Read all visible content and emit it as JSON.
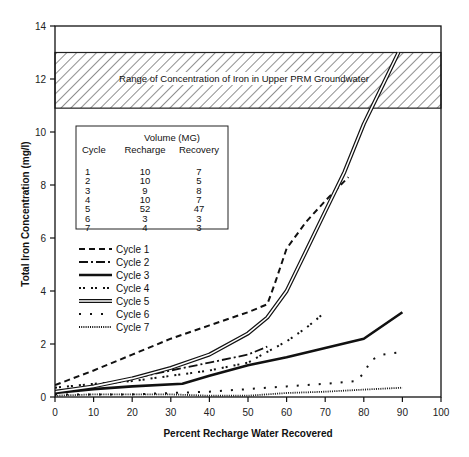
{
  "chart_data": {
    "type": "line",
    "title": "",
    "xlabel": "Percent Recharge Water Recovered",
    "ylabel": "Total Iron Concentration (mg/l)",
    "xlim": [
      0,
      100
    ],
    "ylim": [
      0,
      14
    ],
    "x_ticks": [
      0,
      10,
      20,
      30,
      40,
      50,
      60,
      70,
      80,
      90,
      100
    ],
    "y_ticks": [
      0,
      2,
      4,
      6,
      8,
      10,
      12,
      14
    ],
    "grid": false,
    "legend_position": "left-middle",
    "annotation_band": {
      "label": "Range of Concentration of Iron in Upper PRM Groundwater",
      "y_min": 10.9,
      "y_max": 13.0,
      "pattern": "diagonal-hatch"
    },
    "series": [
      {
        "name": "Cycle 1",
        "style": "dashed",
        "points": [
          [
            0,
            0.45
          ],
          [
            10,
            1.0
          ],
          [
            20,
            1.6
          ],
          [
            30,
            2.2
          ],
          [
            40,
            2.7
          ],
          [
            50,
            3.2
          ],
          [
            55,
            3.5
          ],
          [
            57,
            4.3
          ],
          [
            60,
            5.6
          ],
          [
            65,
            6.6
          ],
          [
            70,
            7.4
          ],
          [
            76,
            8.3
          ]
        ]
      },
      {
        "name": "Cycle 2",
        "style": "dash-dot",
        "points": [
          [
            0,
            0.2
          ],
          [
            10,
            0.4
          ],
          [
            20,
            0.7
          ],
          [
            30,
            1.0
          ],
          [
            40,
            1.3
          ],
          [
            50,
            1.6
          ],
          [
            55,
            1.9
          ]
        ]
      },
      {
        "name": "Cycle 3",
        "style": "thick-solid",
        "points": [
          [
            0,
            0.15
          ],
          [
            10,
            0.3
          ],
          [
            20,
            0.4
          ],
          [
            33,
            0.5
          ],
          [
            40,
            0.8
          ],
          [
            50,
            1.2
          ],
          [
            60,
            1.5
          ],
          [
            70,
            1.85
          ],
          [
            80,
            2.2
          ],
          [
            90,
            3.2
          ]
        ]
      },
      {
        "name": "Cycle 4",
        "style": "dotted-pairs",
        "points": [
          [
            0,
            0.35
          ],
          [
            10,
            0.5
          ],
          [
            20,
            0.6
          ],
          [
            30,
            0.8
          ],
          [
            40,
            1.0
          ],
          [
            50,
            1.3
          ],
          [
            55,
            1.7
          ],
          [
            60,
            2.1
          ],
          [
            65,
            2.6
          ],
          [
            70,
            3.2
          ]
        ]
      },
      {
        "name": "Cycle 5",
        "style": "double-line",
        "points": [
          [
            0,
            0.2
          ],
          [
            10,
            0.4
          ],
          [
            20,
            0.7
          ],
          [
            30,
            1.1
          ],
          [
            40,
            1.6
          ],
          [
            50,
            2.4
          ],
          [
            55,
            3.0
          ],
          [
            60,
            4.0
          ],
          [
            65,
            5.5
          ],
          [
            70,
            7.0
          ],
          [
            75,
            8.5
          ],
          [
            80,
            10.3
          ],
          [
            85,
            11.8
          ],
          [
            89,
            13.0
          ]
        ]
      },
      {
        "name": "Cycle 6",
        "style": "sparse-dotted",
        "points": [
          [
            0,
            0.1
          ],
          [
            10,
            0.1
          ],
          [
            20,
            0.1
          ],
          [
            30,
            0.15
          ],
          [
            40,
            0.2
          ],
          [
            50,
            0.3
          ],
          [
            60,
            0.4
          ],
          [
            70,
            0.5
          ],
          [
            78,
            0.6
          ],
          [
            80,
            0.9
          ],
          [
            82,
            1.4
          ],
          [
            85,
            1.6
          ],
          [
            90,
            1.7
          ]
        ]
      },
      {
        "name": "Cycle 7",
        "style": "dense-dotted",
        "points": [
          [
            0,
            0.05
          ],
          [
            10,
            0.1
          ],
          [
            20,
            0.1
          ],
          [
            30,
            0.1
          ],
          [
            40,
            0.05
          ],
          [
            50,
            0.05
          ],
          [
            60,
            0.15
          ],
          [
            70,
            0.2
          ],
          [
            80,
            0.28
          ],
          [
            90,
            0.35
          ]
        ]
      }
    ],
    "table": {
      "title": "Volume (MG)",
      "columns": [
        "Cycle",
        "Recharge",
        "Recovery"
      ],
      "rows": [
        [
          "1",
          "10",
          "7"
        ],
        [
          "2",
          "10",
          "5"
        ],
        [
          "3",
          "9",
          "8"
        ],
        [
          "4",
          "10",
          "7"
        ],
        [
          "5",
          "52",
          "47"
        ],
        [
          "6",
          "3",
          "3"
        ],
        [
          "7",
          "4",
          "3"
        ]
      ]
    }
  },
  "plot": {
    "band_label": "Range of Concentration of Iron in Upper PRM Groundwater",
    "xlabel": "Percent Recharge Water Recovered",
    "ylabel": "Total Iron Concentration (mg/l)"
  },
  "table": {
    "title": "Volume (MG)",
    "col_cycle": "Cycle",
    "col_recharge": "Recharge",
    "col_recovery": "Recovery"
  },
  "legend": {
    "items": [
      "Cycle 1",
      "Cycle 2",
      "Cycle 3",
      "Cycle 4",
      "Cycle 5",
      "Cycle 6",
      "Cycle 7"
    ]
  },
  "colors": {
    "ink": "#111111",
    "background": "#ffffff"
  }
}
